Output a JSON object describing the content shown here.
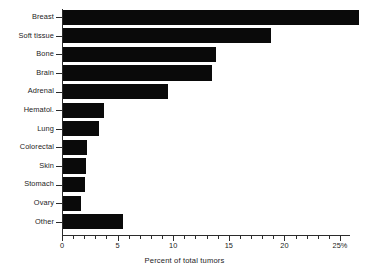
{
  "chart_data": {
    "type": "bar",
    "orientation": "horizontal",
    "title": "",
    "xlabel": "Percent of total tumors",
    "ylabel": "",
    "xlim": [
      0,
      26.5
    ],
    "xticks": [
      0,
      5,
      10,
      15,
      20,
      25
    ],
    "xtick_labels": [
      "0",
      "5",
      "10",
      "15",
      "20",
      "25%"
    ],
    "minor_ticks_between": 4,
    "grid": false,
    "legend": null,
    "bar_color": "#0a0a0a",
    "axis_color": "#2b2b2b",
    "categories": [
      "Breast",
      "Soft tissue",
      "Bone",
      "Brain",
      "Adrenal",
      "Hematol.",
      "Lung",
      "Colorectal",
      "Skin",
      "Stomach",
      "Ovary",
      "Other"
    ],
    "values": [
      26.6,
      18.7,
      13.8,
      13.4,
      9.4,
      3.7,
      3.2,
      2.2,
      2.1,
      2.0,
      1.6,
      5.4
    ]
  }
}
